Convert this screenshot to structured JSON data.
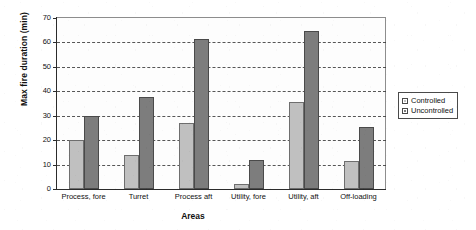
{
  "chart_data": {
    "type": "bar",
    "title": "",
    "xlabel": "Areas",
    "ylabel": "Max fire duration (min)",
    "categories": [
      "Process, fore",
      "Turret",
      "Process aft",
      "Utility, fore",
      "Utility, aft",
      "Off-loading"
    ],
    "series": [
      {
        "name": "Controlled",
        "color": "#c0c0c0",
        "values": [
          20,
          14,
          27,
          2,
          35.5,
          11.5
        ]
      },
      {
        "name": "Uncontrolled",
        "color": "#7d7d7d",
        "values": [
          30,
          37.5,
          61.5,
          12,
          64.5,
          25.5
        ]
      }
    ],
    "ylim": [
      0,
      70
    ],
    "ytick_labels": [
      "0",
      "10",
      "20",
      "30",
      "40",
      "50",
      "60",
      "70"
    ],
    "ytick_values": [
      0,
      10,
      20,
      30,
      40,
      50,
      60,
      70
    ],
    "grid": true,
    "grid_style": "dashed",
    "legend_position": "right",
    "legend": [
      {
        "label": "Controlled",
        "swatch": "light-gray-square"
      },
      {
        "label": "Uncontrolled",
        "swatch": "dark-gray-square"
      }
    ]
  }
}
